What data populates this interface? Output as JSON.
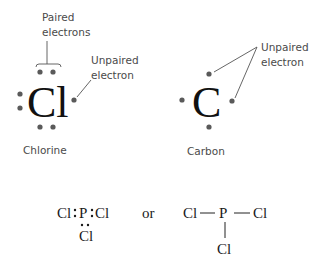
{
  "chlorine": {
    "symbol": "Cl",
    "name": "Chlorine",
    "paired_label_line1": "Paired",
    "paired_label_line2": "electrons",
    "unpaired_label_line1": "Unpaired",
    "unpaired_label_line2": "electron",
    "valence_electrons": 7,
    "paired_electrons": 6,
    "unpaired_electrons": 1
  },
  "carbon": {
    "symbol": "C",
    "name": "Carbon",
    "unpaired_label_line1": "Unpaired",
    "unpaired_label_line2": "electron",
    "valence_electrons": 4,
    "unpaired_electrons": 4
  },
  "pcl3": {
    "dot_left_cl": "Cl",
    "dot_p": "P",
    "dot_right_cl": "Cl",
    "dot_bottom_cl": "Cl",
    "separator": "or",
    "line_left_cl": "Cl",
    "line_p": "P",
    "line_right_cl": "Cl",
    "line_bottom_cl": "Cl"
  },
  "colors": {
    "background": "#ffffff",
    "electron_dot": "#5a5a5a",
    "text": "#4a4a4a",
    "symbol": "#111111"
  }
}
